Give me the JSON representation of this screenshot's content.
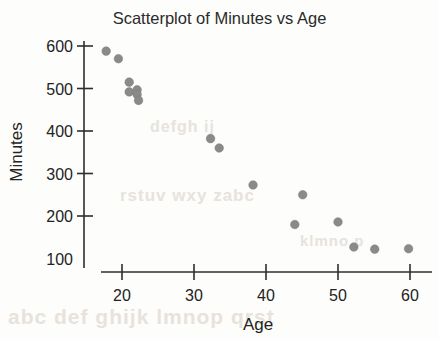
{
  "chart_data": {
    "type": "scatter",
    "title": "Scatterplot of Minutes vs Age",
    "xlabel": "Age",
    "ylabel": "Minutes",
    "xlim": [
      16,
      63
    ],
    "ylim": [
      75,
      615
    ],
    "grid": false,
    "legend": null,
    "xticks": [
      20,
      30,
      40,
      50,
      60
    ],
    "xtick_labels": [
      "20",
      "30",
      "40",
      "50",
      "60"
    ],
    "yticks": [
      200,
      300,
      400,
      500,
      600
    ],
    "ytick_labels": [
      "100",
      "200",
      "300",
      "400",
      "500",
      "600"
    ],
    "ytick_label_values": [
      100,
      200,
      300,
      400,
      500,
      600
    ],
    "marker": {
      "shape": "circle",
      "color": "#8a8a8a",
      "radius_px": 4.3
    },
    "series": [
      {
        "name": "Minutes vs Age",
        "points": [
          {
            "x": 17.8,
            "y": 588
          },
          {
            "x": 19.5,
            "y": 570
          },
          {
            "x": 21.0,
            "y": 515
          },
          {
            "x": 21.0,
            "y": 492
          },
          {
            "x": 22.1,
            "y": 497
          },
          {
            "x": 22.1,
            "y": 486
          },
          {
            "x": 22.3,
            "y": 472
          },
          {
            "x": 32.3,
            "y": 382
          },
          {
            "x": 33.5,
            "y": 360
          },
          {
            "x": 38.2,
            "y": 273
          },
          {
            "x": 45.1,
            "y": 250
          },
          {
            "x": 44.0,
            "y": 180
          },
          {
            "x": 50.0,
            "y": 186
          },
          {
            "x": 52.2,
            "y": 127
          },
          {
            "x": 55.1,
            "y": 122
          },
          {
            "x": 59.8,
            "y": 123
          }
        ]
      }
    ]
  },
  "figure": {
    "background_color": "#fdfdfb",
    "axis_color": "#2e2e2e",
    "text_color": "#232323",
    "bleed_text": {
      "line1": "abc def ghijk lmnop qrst",
      "line2": "rstuv wxy zabc",
      "line3": "defgh ij",
      "line4": "klmno p"
    }
  }
}
